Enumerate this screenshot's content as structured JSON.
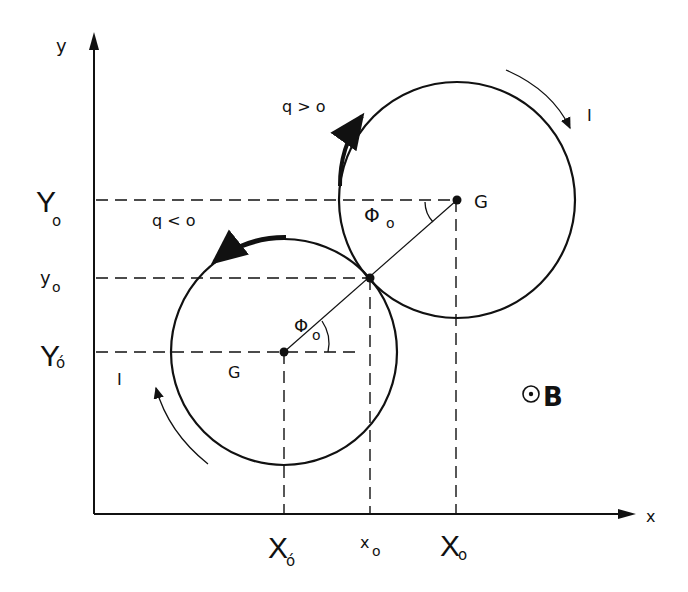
{
  "diagram": {
    "axes": {
      "x_label": "x",
      "y_label": "y"
    },
    "y_ticks": {
      "Y0": "Y",
      "Y0_sub": "o",
      "y0": "y",
      "y0_sub": "o",
      "Y0p": "Y",
      "Y0p_sub": "ó"
    },
    "x_ticks": {
      "X0p": "X",
      "X0p_sub": "ó",
      "x0": "x",
      "x0_sub": "o",
      "X0": "X",
      "X0_sub": "o"
    },
    "upper_circle": {
      "center_label": "G",
      "charge_label": "q > o",
      "current_label": "I",
      "angle_label": "Φ",
      "angle_sub": "o"
    },
    "lower_circle": {
      "center_label": "G",
      "charge_label": "q < o",
      "current_label": "I",
      "angle_label": "Φ",
      "angle_sub": "o"
    },
    "field": {
      "symbol": "⊙",
      "label": "B"
    }
  }
}
